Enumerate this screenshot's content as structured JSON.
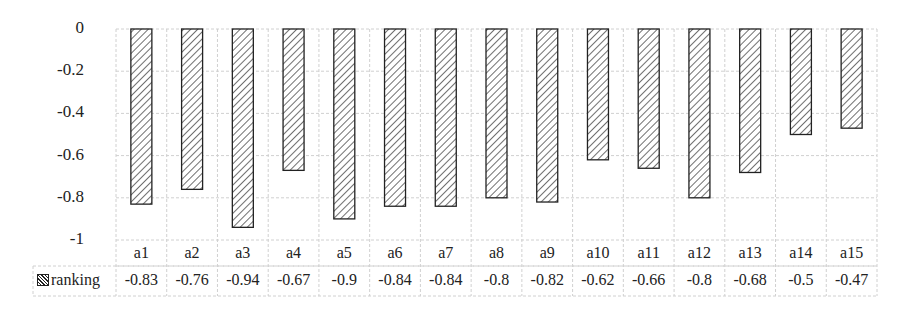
{
  "chart_data": {
    "type": "bar",
    "title": "",
    "xlabel": "",
    "ylabel": "",
    "categories": [
      "a1",
      "a2",
      "a3",
      "a4",
      "a5",
      "a6",
      "a7",
      "a8",
      "a9",
      "a10",
      "a11",
      "a12",
      "a13",
      "a14",
      "a15"
    ],
    "series": [
      {
        "name": "ranking",
        "values": [
          -0.83,
          -0.76,
          -0.94,
          -0.67,
          -0.9,
          -0.84,
          -0.84,
          -0.8,
          -0.82,
          -0.62,
          -0.66,
          -0.8,
          -0.68,
          -0.5,
          -0.47
        ],
        "value_labels": [
          "-0.83",
          "-0.76",
          "-0.94",
          "-0.67",
          "-0.9",
          "-0.84",
          "-0.84",
          "-0.8",
          "-0.82",
          "-0.62",
          "-0.66",
          "-0.8",
          "-0.68",
          "-0.5",
          "-0.47"
        ],
        "pattern": "diagonal-hatch",
        "color": "#222222"
      }
    ],
    "ylim": [
      -1,
      0
    ],
    "yticks": [
      "0",
      "-0.2",
      "-0.4",
      "-0.6",
      "-0.8",
      "-1"
    ],
    "ytick_values": [
      0,
      -0.2,
      -0.4,
      -0.6,
      -0.8,
      -1
    ],
    "grid": true,
    "legend": {
      "position": "data-table-left",
      "entries": [
        "ranking"
      ]
    },
    "data_table": true
  },
  "colors": {
    "grid": "#d0d0d0",
    "bar_stroke": "#222222",
    "background": "#ffffff"
  }
}
